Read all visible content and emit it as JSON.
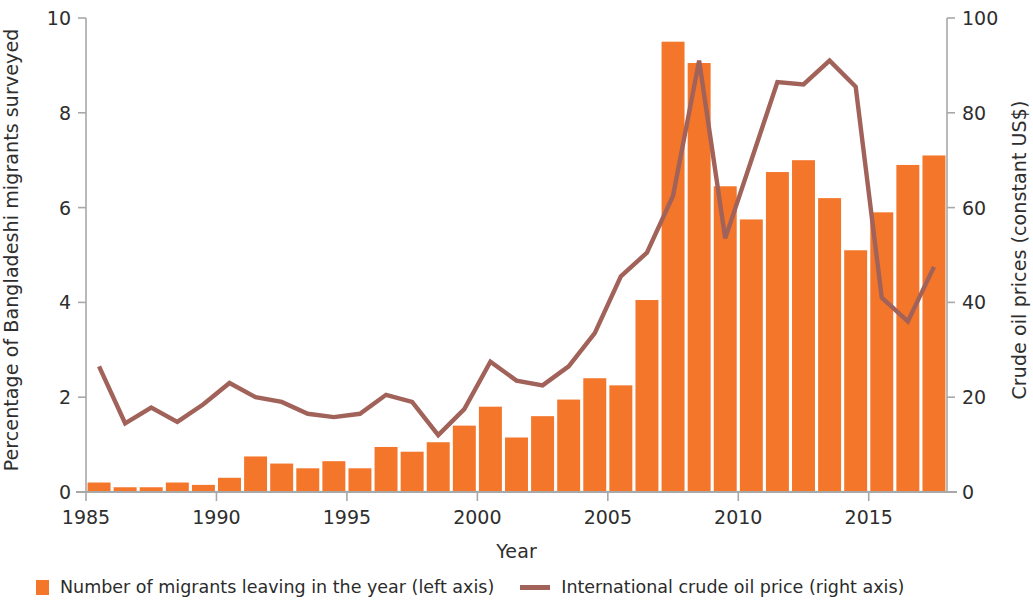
{
  "chart_data": {
    "type": "bar",
    "title": "",
    "xlabel": "Year",
    "ylabel": "Percentage of Bangladeshi migrants surveyed",
    "ylabel_right": "Crude oil prices (constant US$)",
    "ylim": [
      0,
      10
    ],
    "ylim_right": [
      0,
      100
    ],
    "grid": false,
    "legend_position": "bottom-left",
    "xticks": [
      "1985",
      "1990",
      "1995",
      "2000",
      "2005",
      "2010",
      "2015"
    ],
    "yticks_left": [
      "0",
      "2",
      "4",
      "6",
      "8",
      "10"
    ],
    "yticks_right": [
      "0",
      "20",
      "40",
      "60",
      "80",
      "100"
    ],
    "categories": [
      "1985",
      "1986",
      "1987",
      "1988",
      "1989",
      "1990",
      "1991",
      "1992",
      "1993",
      "1994",
      "1995",
      "1996",
      "1997",
      "1998",
      "1999",
      "2000",
      "2001",
      "2002",
      "2003",
      "2004",
      "2005",
      "2006",
      "2007",
      "2008",
      "2009",
      "2010",
      "2011",
      "2012",
      "2013",
      "2014",
      "2015",
      "2016",
      "2017"
    ],
    "series": [
      {
        "name": "Number of migrants leaving in the year (left axis)",
        "axis": "left",
        "type": "bar",
        "color": "#F4762B",
        "values": [
          0.2,
          0.1,
          0.1,
          0.2,
          0.15,
          0.3,
          0.75,
          0.6,
          0.5,
          0.65,
          0.5,
          0.95,
          0.85,
          1.05,
          1.4,
          1.8,
          1.15,
          1.6,
          1.95,
          2.4,
          2.25,
          4.05,
          9.5,
          9.05,
          6.45,
          5.75,
          6.75,
          7.0,
          6.2,
          5.1,
          5.9,
          6.9,
          7.1
        ]
      },
      {
        "name": "International crude oil price (right axis)",
        "axis": "right",
        "type": "line",
        "color": "#A1625A",
        "values": [
          26.5,
          14.5,
          17.8,
          14.8,
          18.5,
          23.0,
          20.0,
          19.0,
          16.5,
          15.8,
          16.5,
          20.5,
          19.0,
          12.0,
          17.5,
          27.5,
          23.5,
          22.5,
          26.5,
          33.5,
          45.5,
          50.5,
          62.5,
          91.0,
          53.5,
          70.0,
          86.5,
          86.0,
          91.0,
          85.5,
          41.0,
          36.0,
          47.5
        ]
      }
    ],
    "legend": [
      {
        "label": "Number of migrants leaving in the year (left axis)",
        "marker": "square",
        "color": "#F4762B"
      },
      {
        "label": "International crude oil price (right axis)",
        "marker": "line",
        "color": "#A1625A"
      }
    ]
  },
  "colors": {
    "bar": "#F4762B",
    "line": "#A1625A",
    "axis": "#a8a8a8",
    "text": "#2e2e2e"
  }
}
